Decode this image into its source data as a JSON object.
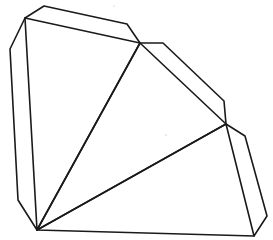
{
  "diagram": {
    "type": "pyramid-net",
    "stroke_color": "#1a1a1a",
    "background_color": "#ffffff",
    "faces": [
      {
        "id": "face-1",
        "label": ""
      },
      {
        "id": "face-2",
        "label": ""
      },
      {
        "id": "face-3",
        "label": ""
      }
    ],
    "flaps": [
      {
        "id": "flap-left",
        "label": ""
      },
      {
        "id": "flap-top",
        "label": ""
      },
      {
        "id": "flap-upper-right",
        "label": ""
      },
      {
        "id": "flap-lower-right",
        "label": ""
      }
    ]
  }
}
